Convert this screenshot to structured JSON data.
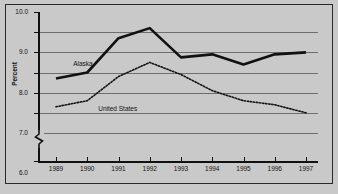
{
  "chart_data": {
    "type": "line",
    "title": "",
    "xlabel": "",
    "ylabel": "Percent",
    "x": [
      "1989",
      "1990",
      "1991",
      "1992",
      "1993",
      "1994",
      "1995",
      "1996",
      "1997"
    ],
    "ylim": [
      4.0,
      10.0
    ],
    "y_ticks": [
      "10.0",
      "9.0",
      "8.0",
      "7.0",
      "6.0",
      "5.0",
      "4.0",
      "0"
    ],
    "y_tick_values": [
      10.0,
      9.0,
      8.0,
      7.0,
      6.0,
      5.0,
      4.0,
      0
    ],
    "axis_break": true,
    "grid": "horizontal",
    "legend": "inline-labels",
    "series": [
      {
        "name": "Alaska",
        "style": "solid-thick",
        "color": "#111111",
        "values": [
          6.7,
          7.0,
          8.7,
          9.2,
          7.75,
          7.9,
          7.4,
          7.9,
          8.0
        ]
      },
      {
        "name": "United States",
        "style": "dotted",
        "color": "#111111",
        "values": [
          5.3,
          5.6,
          6.8,
          7.5,
          6.9,
          6.1,
          5.6,
          5.4,
          5.0
        ]
      }
    ],
    "annotations": [
      {
        "text": "Alaska",
        "x": 1989.55,
        "y": 7.35
      },
      {
        "text": "United States",
        "x": 1990.35,
        "y": 5.15
      }
    ]
  }
}
